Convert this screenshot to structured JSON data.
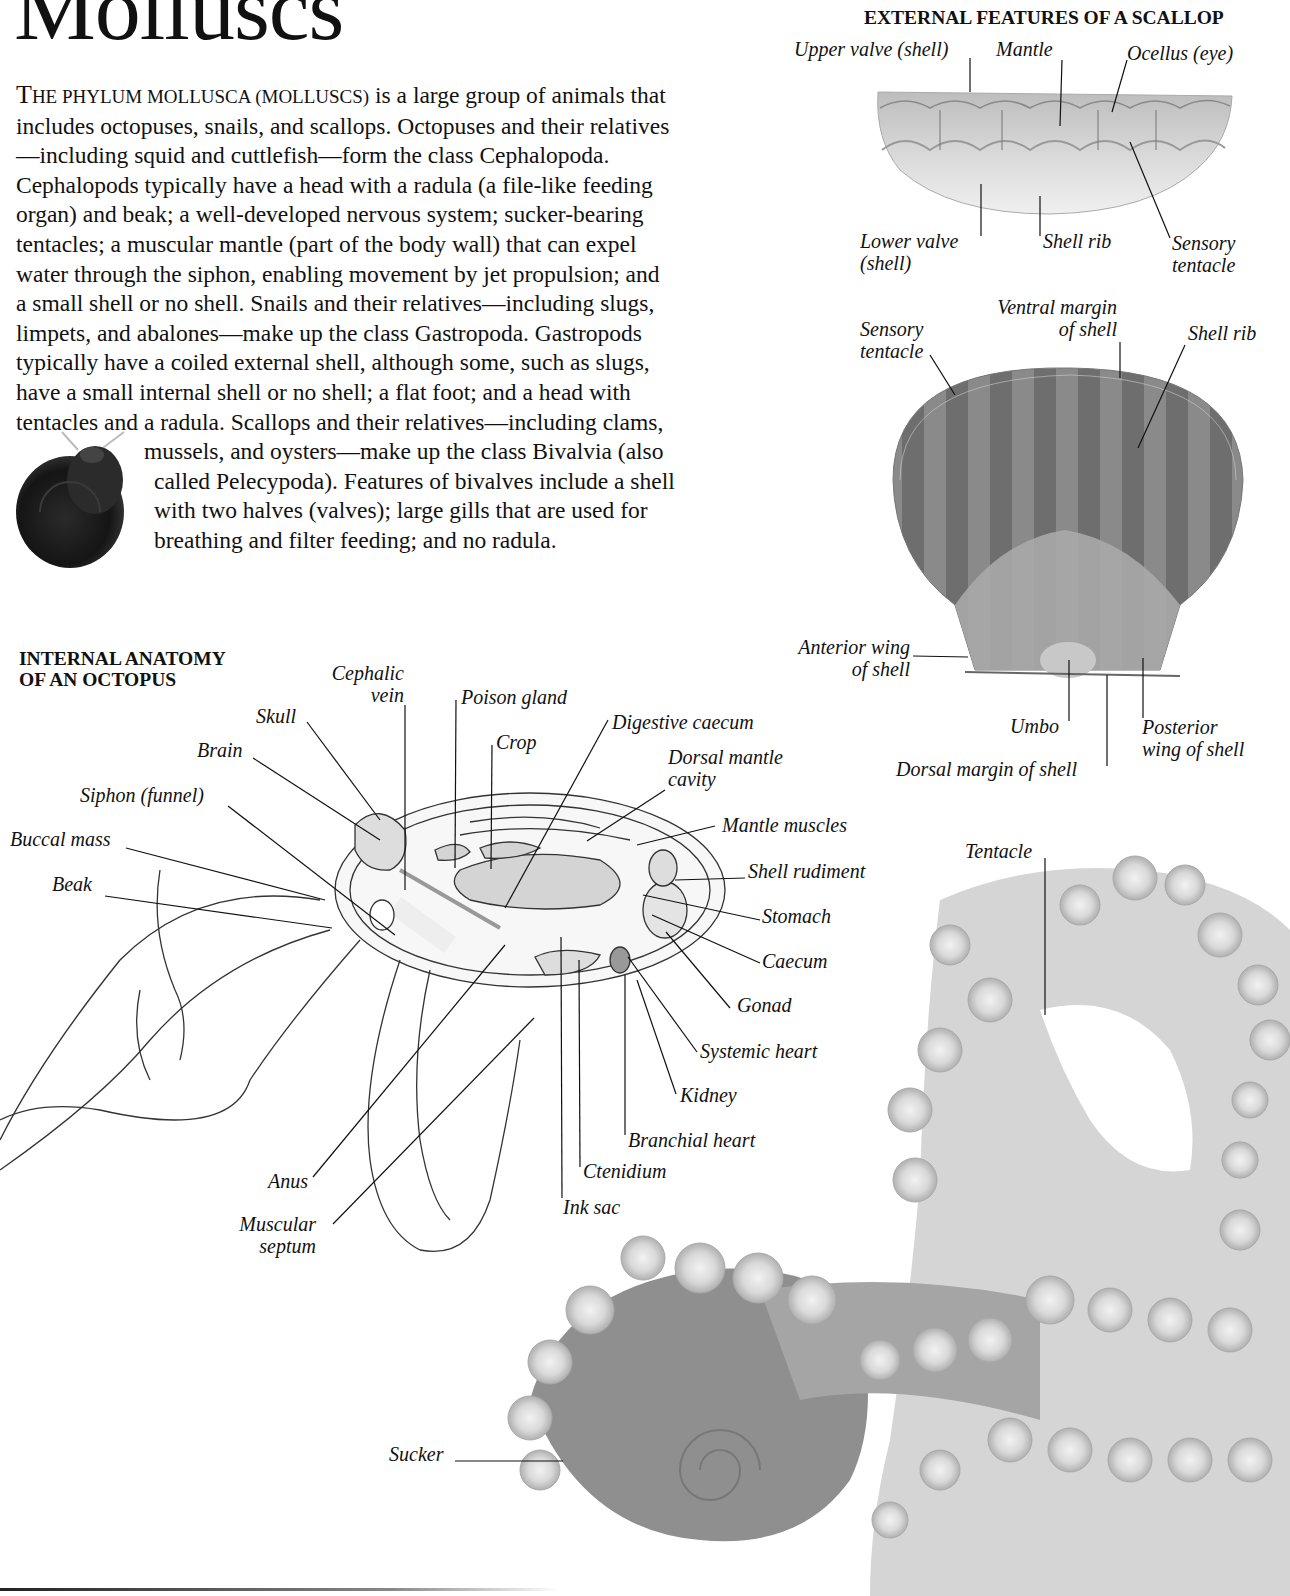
{
  "page": {
    "title": "Molluscs",
    "intro": {
      "lead_cap": "T",
      "lead_smallcaps": "HE PHYLUM MOLLUSCA (MOLLUSCS)",
      "lines": [
        " is a large group of animals that",
        "includes octopuses, snails, and scallops. Octopuses and their relatives",
        "—including squid and cuttlefish—form the class Cephalopoda.",
        "Cephalopods typically have a head with a radula (a file-like feeding",
        "organ) and beak; a well-developed nervous system; sucker-bearing",
        "tentacles; a muscular mantle (part of the body wall) that can expel",
        "water through the siphon, enabling movement by jet propulsion; and",
        "a small shell or no shell. Snails and their relatives—including slugs,",
        "limpets, and abalones—make up the class Gastropoda. Gastropods",
        "typically have a coiled external shell, although some, such as slugs,",
        "have a small internal shell or no shell; a flat foot; and a head with",
        "tentacles and a radula. Scallops and their relatives—including clams,",
        "mussels, and oysters—make up the class Bivalvia (also",
        "called Pelecypoda). Features of bivalves include a shell",
        "with two halves (valves); large gills that are used for",
        "breathing and filter feeding; and no radula."
      ]
    }
  },
  "scallop": {
    "heading": "External features of a scallop",
    "side_view_labels": {
      "upper_valve": "Upper valve (shell)",
      "mantle": "Mantle",
      "ocellus": "Ocellus (eye)",
      "lower_valve_1": "Lower valve",
      "lower_valve_2": "(shell)",
      "shell_rib": "Shell rib",
      "sensory_tentacle_1": "Sensory",
      "sensory_tentacle_2": "tentacle"
    },
    "top_view_labels": {
      "sensory_tentacle_1": "Sensory",
      "sensory_tentacle_2": "tentacle",
      "ventral_margin_1": "Ventral margin",
      "ventral_margin_2": "of shell",
      "shell_rib": "Shell rib",
      "anterior_wing_1": "Anterior wing",
      "anterior_wing_2": "of shell",
      "umbo": "Umbo",
      "posterior_wing_1": "Posterior",
      "posterior_wing_2": "wing of shell",
      "dorsal_margin": "Dorsal margin of shell"
    }
  },
  "octopus": {
    "heading_1": "Internal anatomy",
    "heading_2": "of an octopus",
    "labels": {
      "cephalic_vein_1": "Cephalic",
      "cephalic_vein_2": "vein",
      "poison_gland": "Poison gland",
      "skull": "Skull",
      "crop": "Crop",
      "digestive_caecum": "Digestive caecum",
      "brain": "Brain",
      "dorsal_mantle_cavity_1": "Dorsal mantle",
      "dorsal_mantle_cavity_2": "cavity",
      "siphon": "Siphon (funnel)",
      "mantle_muscles": "Mantle muscles",
      "buccal_mass": "Buccal mass",
      "shell_rudiment": "Shell rudiment",
      "beak": "Beak",
      "stomach": "Stomach",
      "caecum": "Caecum",
      "gonad": "Gonad",
      "systemic_heart": "Systemic heart",
      "kidney": "Kidney",
      "branchial_heart": "Branchial heart",
      "ctenidium": "Ctenidium",
      "anus": "Anus",
      "ink_sac": "Ink sac",
      "muscular_septum_1": "Muscular",
      "muscular_septum_2": "septum"
    }
  },
  "photo_octopus": {
    "labels": {
      "tentacle": "Tentacle",
      "sucker": "Sucker"
    }
  }
}
